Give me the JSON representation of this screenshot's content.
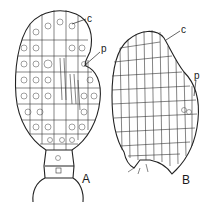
{
  "figure": {
    "panels": [
      {
        "id": "A",
        "label": "A",
        "annotations": [
          {
            "key": "c",
            "text": "c"
          },
          {
            "key": "p",
            "text": "p"
          }
        ]
      },
      {
        "id": "B",
        "label": "B",
        "annotations": [
          {
            "key": "c",
            "text": "c"
          },
          {
            "key": "p",
            "text": "p"
          }
        ]
      }
    ],
    "colors": {
      "ink": "#222222",
      "background": "#ffffff"
    }
  }
}
